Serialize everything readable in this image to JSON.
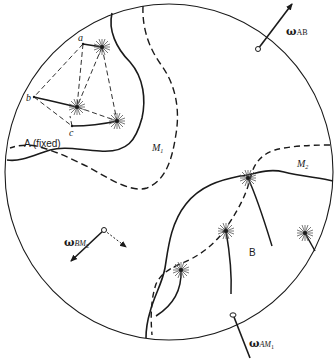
{
  "figure": {
    "type": "mechanism-diagram",
    "regions": {
      "fixed_body": "A (fixed)",
      "moving_body": "B",
      "mobile_1": "M",
      "mobile_1_sub": "1",
      "mobile_2": "M",
      "mobile_2_sub": "2"
    },
    "points": {
      "a": "a",
      "b": "b",
      "c": "c"
    },
    "vectors": {
      "omega_AB": {
        "symbol": "ω",
        "subscript": "AB"
      },
      "omega_BM2": {
        "symbol": "ω",
        "subscript": "BM",
        "subscript_index": "2"
      },
      "omega_AM1": {
        "symbol": "ω",
        "subscript": "AM",
        "subscript_index": "1"
      }
    },
    "colors": {
      "ink": "#1a1a1a",
      "background": "#ffffff"
    }
  }
}
